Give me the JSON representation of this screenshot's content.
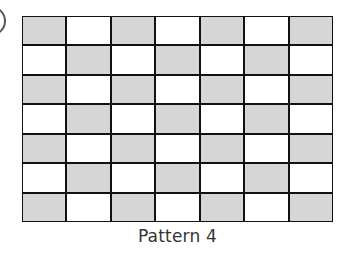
{
  "figure": {
    "label": "Pattern 4",
    "rows": 7,
    "columns": 7,
    "shaded_color": "#d6d6d6",
    "unshaded_color": "#ffffff",
    "line_color": "#111111",
    "pattern": [
      [
        1,
        0,
        1,
        0,
        1,
        0,
        1
      ],
      [
        0,
        1,
        0,
        1,
        0,
        1,
        0
      ],
      [
        1,
        0,
        1,
        0,
        1,
        0,
        1
      ],
      [
        0,
        1,
        0,
        1,
        0,
        1,
        0
      ],
      [
        1,
        0,
        1,
        0,
        1,
        0,
        1
      ],
      [
        0,
        1,
        0,
        1,
        0,
        1,
        0
      ],
      [
        1,
        0,
        1,
        0,
        1,
        0,
        1
      ]
    ]
  }
}
